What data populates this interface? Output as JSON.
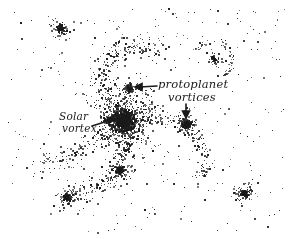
{
  "figure": {
    "background_color": "#ffffff",
    "ink_color": "#1a1a1a",
    "labels": {
      "solar_line1": "Solar",
      "solar_line2": "vortex",
      "proto_line1": "protoplanet",
      "proto_line2": "vortices"
    },
    "arrows": [
      {
        "name": "solar-vortex-arrow",
        "from": [
          92,
          126
        ],
        "to": [
          114,
          119
        ]
      },
      {
        "name": "protoplanet-arrow-upper",
        "from": [
          157,
          86
        ],
        "to": [
          137,
          87
        ]
      },
      {
        "name": "protoplanet-arrow-lower",
        "from": [
          186,
          104
        ],
        "to": [
          186,
          115
        ]
      }
    ],
    "clusters": [
      {
        "name": "solar-vortex-core",
        "cx": 123,
        "cy": 120,
        "r": 38,
        "count": 900,
        "core": 7
      },
      {
        "name": "protoplanet-vortex-upper",
        "cx": 129,
        "cy": 88,
        "r": 8,
        "count": 60,
        "core": 4
      },
      {
        "name": "protoplanet-vortex-right",
        "cx": 186,
        "cy": 124,
        "r": 10,
        "count": 110,
        "core": 5
      },
      {
        "name": "cluster-lower-middle",
        "cx": 120,
        "cy": 170,
        "r": 12,
        "count": 110,
        "core": 4
      },
      {
        "name": "cluster-top-left",
        "cx": 60,
        "cy": 28,
        "r": 12,
        "count": 70,
        "core": 3
      },
      {
        "name": "cluster-top-right",
        "cx": 213,
        "cy": 58,
        "r": 8,
        "count": 45,
        "core": 2
      },
      {
        "name": "cluster-bottom-left",
        "cx": 66,
        "cy": 197,
        "r": 12,
        "count": 90,
        "core": 3
      },
      {
        "name": "cluster-bottom-right",
        "cx": 244,
        "cy": 193,
        "r": 12,
        "count": 90,
        "core": 3
      }
    ],
    "spiral_arms": [
      {
        "name": "arm-upper-left",
        "points": [
          [
            123,
            120
          ],
          [
            110,
            100
          ],
          [
            100,
            80
          ],
          [
            105,
            60
          ],
          [
            120,
            48
          ],
          [
            140,
            45
          ],
          [
            160,
            52
          ]
        ],
        "count": 260,
        "spread": 9
      },
      {
        "name": "arm-right",
        "points": [
          [
            123,
            120
          ],
          [
            145,
            115
          ],
          [
            165,
            118
          ],
          [
            185,
            124
          ],
          [
            200,
            140
          ],
          [
            205,
            160
          ],
          [
            200,
            180
          ]
        ],
        "count": 200,
        "spread": 7
      },
      {
        "name": "arm-lower",
        "points": [
          [
            123,
            120
          ],
          [
            128,
            140
          ],
          [
            122,
            160
          ],
          [
            110,
            180
          ],
          [
            90,
            190
          ],
          [
            66,
            197
          ]
        ],
        "count": 200,
        "spread": 7
      },
      {
        "name": "arm-left",
        "points": [
          [
            123,
            120
          ],
          [
            100,
            135
          ],
          [
            80,
            150
          ],
          [
            60,
            160
          ],
          [
            35,
            165
          ]
        ],
        "count": 130,
        "spread": 8
      },
      {
        "name": "ring-top-right",
        "points": [
          [
            195,
            50
          ],
          [
            205,
            40
          ],
          [
            222,
            42
          ],
          [
            232,
            55
          ],
          [
            228,
            70
          ],
          [
            218,
            78
          ]
        ],
        "count": 60,
        "spread": 3
      }
    ],
    "background_dust_count": 330
  }
}
